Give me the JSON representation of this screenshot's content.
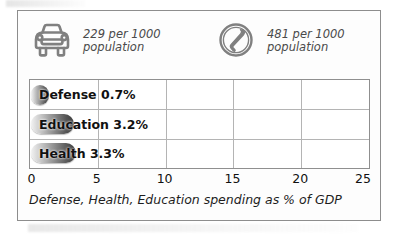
{
  "card": {
    "stats": [
      {
        "icon": "car-icon",
        "value_line": "229 per 1000",
        "unit_line": "population",
        "value": 229,
        "per": 1000,
        "metric": "cars per 1000 population"
      },
      {
        "icon": "telephone-icon",
        "value_line": "481 per 1000",
        "unit_line": "population",
        "value": 481,
        "per": 1000,
        "metric": "telephones per 1000 population"
      }
    ],
    "caption": "Defense, Health, Education spending as % of GDP"
  },
  "chart_data": {
    "type": "bar",
    "orientation": "horizontal",
    "title": "",
    "subtitle": "",
    "caption": "Defense, Health, Education spending as % of GDP",
    "categories": [
      "Defense",
      "Education",
      "Health"
    ],
    "values": [
      0.7,
      3.2,
      3.3
    ],
    "value_labels": [
      "0.7%",
      "3.2%",
      "3.3%"
    ],
    "bar_labels": [
      "Defense 0.7%",
      "Education 3.2%",
      "Health 3.3%"
    ],
    "xlabel": "",
    "ylabel": "",
    "xlim": [
      0,
      25
    ],
    "ticks": [
      0,
      5,
      10,
      15,
      20,
      25
    ],
    "tick_labels": [
      "0",
      "5",
      "10",
      "15",
      "20",
      "25"
    ],
    "grid": true,
    "legend": false,
    "unit": "% of GDP",
    "colors": {
      "bar_light": "#f2f2f2",
      "bar_dark": "#3d3d3d",
      "grid": "#b4b4b4",
      "border": "#8d8d8d",
      "text": "#111111",
      "icon": "#7a7a7a"
    }
  }
}
